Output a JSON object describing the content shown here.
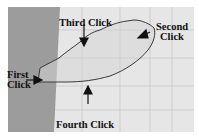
{
  "canvas": {
    "background_left": "#9a9a9a",
    "background_right": "#e4e4e4",
    "grid_color": "#cfcfcf",
    "outline_color": "#3a3a3a",
    "region_fill": "#d9d9d9"
  },
  "annotations": {
    "first_click": {
      "line1": "First",
      "line2": "Click"
    },
    "second_click": {
      "line1": "Second",
      "line2": "Click"
    },
    "third_click": {
      "line1": "Third Click"
    },
    "fourth_click": {
      "line1": "Fourth Click"
    }
  }
}
